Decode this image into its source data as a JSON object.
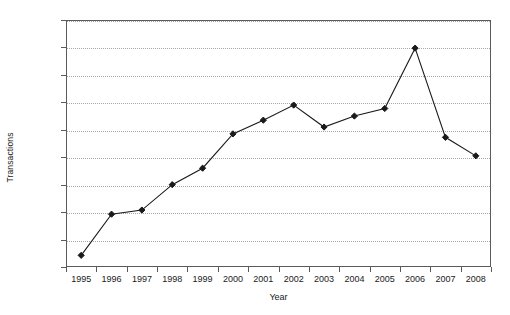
{
  "chart_data": {
    "type": "line",
    "title": "",
    "xlabel": "Year",
    "ylabel": "Transactions",
    "categories": [
      "1995",
      "1996",
      "1997",
      "1998",
      "1999",
      "2000",
      "2001",
      "2002",
      "2003",
      "2004",
      "2005",
      "2006",
      "2007",
      "2008"
    ],
    "series": [
      {
        "name": "Transactions",
        "values": [
          850,
          3850,
          4150,
          6000,
          7200,
          9700,
          10700,
          11800,
          10200,
          11000,
          11550,
          15950,
          9450,
          8100
        ]
      }
    ],
    "ylim": [
      0,
      18000
    ],
    "ytick_values": [
      0,
      2000,
      4000,
      6000,
      8000,
      10000,
      12000,
      14000,
      16000,
      18000
    ],
    "ytick_labels": [
      "0",
      "2 000",
      "4 000",
      "6 000",
      "8 000",
      "10 000",
      "12 000",
      "14 000",
      "16 000",
      "18 000"
    ],
    "xtick_labels": [
      "1995",
      "1996",
      "1997",
      "1998",
      "1999",
      "2000",
      "2001",
      "2002",
      "2003",
      "2004",
      "2005",
      "2006",
      "2007",
      "2008"
    ],
    "grid": "horizontal-dotted",
    "legend": "none",
    "marker": "diamond",
    "colors": {
      "line": "#1a1a1a",
      "marker": "#1a1a1a",
      "grid": "#a8a8a8",
      "axis": "#5a5a5a",
      "background": "#ffffff",
      "text": "#1a1a1a"
    }
  }
}
